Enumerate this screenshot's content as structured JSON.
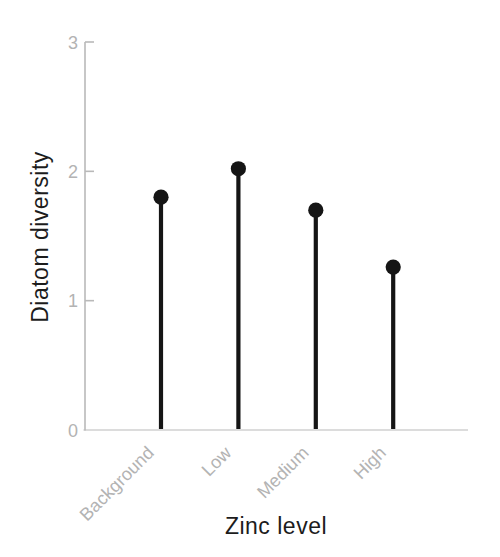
{
  "chart_data": {
    "type": "bar",
    "variant": "lollipop",
    "title": "",
    "xlabel": "Zinc level",
    "ylabel": "Diatom diversity",
    "categories": [
      "Background",
      "Low",
      "Medium",
      "High"
    ],
    "values": [
      1.8,
      2.02,
      1.7,
      1.26
    ],
    "ylim": [
      0,
      3
    ],
    "yticks": [
      0,
      1,
      2,
      3
    ],
    "grid": false,
    "legend": "none",
    "x_tick_rotation_deg": 45,
    "colors": {
      "stem": "#151515",
      "marker": "#151515",
      "axis": "#b9b9b9",
      "tick_labels": "#b3b3b3",
      "axis_titles": "#1c1c1c",
      "background": "#ffffff"
    }
  }
}
